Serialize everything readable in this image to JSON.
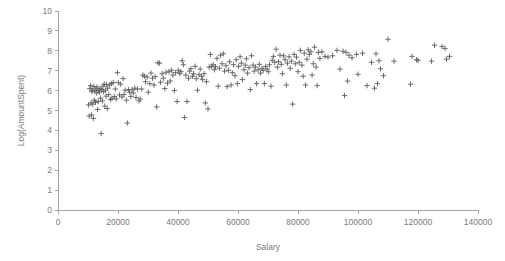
{
  "chart_data": {
    "type": "scatter",
    "title": "",
    "xlabel": "Salary",
    "ylabel": "Log(AmountSpent)",
    "xlim": [
      0,
      140000
    ],
    "ylim": [
      0,
      10
    ],
    "xticks": [
      0,
      20000,
      40000,
      60000,
      80000,
      100000,
      120000,
      140000
    ],
    "xtick_labels": [
      "0",
      "20000",
      "40000",
      "60000",
      "80000",
      "100000",
      "120000",
      "140000"
    ],
    "yticks": [
      0,
      1,
      2,
      3,
      4,
      5,
      6,
      7,
      8,
      9,
      10
    ],
    "ytick_labels": [
      "0",
      "1",
      "2",
      "3",
      "4",
      "5",
      "6",
      "7",
      "8",
      "9",
      "10"
    ],
    "grid": false,
    "legend": false,
    "marker": "plus",
    "marker_color": "#5d5d5d",
    "axis_color": "#9a9a9a",
    "text_color": "#7b7b7b",
    "series": [
      {
        "name": "Customers",
        "points": [
          [
            10200,
            5.28
          ],
          [
            10400,
            4.72
          ],
          [
            10600,
            6.1
          ],
          [
            10900,
            6.25
          ],
          [
            11000,
            5.38
          ],
          [
            11200,
            4.78
          ],
          [
            11300,
            5.95
          ],
          [
            11500,
            6.02
          ],
          [
            11600,
            5.32
          ],
          [
            11800,
            4.6
          ],
          [
            12000,
            6.2
          ],
          [
            12100,
            5.52
          ],
          [
            12300,
            5.98
          ],
          [
            12500,
            5.41
          ],
          [
            12700,
            6.08
          ],
          [
            12900,
            5.88
          ],
          [
            13000,
            6.18
          ],
          [
            13200,
            5.05
          ],
          [
            13400,
            5.45
          ],
          [
            13600,
            6.0
          ],
          [
            13800,
            5.92
          ],
          [
            14000,
            6.1
          ],
          [
            14200,
            5.62
          ],
          [
            14400,
            3.84
          ],
          [
            14600,
            6.05
          ],
          [
            14800,
            5.48
          ],
          [
            15000,
            6.22
          ],
          [
            15200,
            5.95
          ],
          [
            15400,
            6.32
          ],
          [
            15600,
            5.22
          ],
          [
            15800,
            6.02
          ],
          [
            16000,
            5.72
          ],
          [
            16200,
            6.3
          ],
          [
            16400,
            5.1
          ],
          [
            16600,
            6.12
          ],
          [
            16900,
            5.8
          ],
          [
            17200,
            6.28
          ],
          [
            17500,
            5.55
          ],
          [
            17800,
            6.35
          ],
          [
            18000,
            5.62
          ],
          [
            18400,
            6.4
          ],
          [
            18800,
            5.7
          ],
          [
            19100,
            6.08
          ],
          [
            19400,
            5.58
          ],
          [
            19800,
            6.9
          ],
          [
            20100,
            6.4
          ],
          [
            20500,
            5.78
          ],
          [
            20900,
            6.32
          ],
          [
            21300,
            5.68
          ],
          [
            21700,
            6.6
          ],
          [
            22000,
            5.8
          ],
          [
            22400,
            6.02
          ],
          [
            22800,
            5.52
          ],
          [
            23100,
            4.37
          ],
          [
            23500,
            6.05
          ],
          [
            23900,
            5.92
          ],
          [
            24300,
            5.7
          ],
          [
            24700,
            6.05
          ],
          [
            25100,
            5.88
          ],
          [
            25600,
            6.12
          ],
          [
            26000,
            5.65
          ],
          [
            26500,
            6.08
          ],
          [
            27000,
            5.48
          ],
          [
            27400,
            5.58
          ],
          [
            27900,
            6.08
          ],
          [
            28300,
            6.78
          ],
          [
            28800,
            6.72
          ],
          [
            29200,
            6.45
          ],
          [
            29700,
            6.68
          ],
          [
            30100,
            5.92
          ],
          [
            30600,
            6.35
          ],
          [
            31000,
            6.88
          ],
          [
            31500,
            6.62
          ],
          [
            32000,
            6.28
          ],
          [
            32400,
            6.7
          ],
          [
            32900,
            5.18
          ],
          [
            33300,
            7.4
          ],
          [
            33800,
            7.38
          ],
          [
            34200,
            6.42
          ],
          [
            34700,
            6.85
          ],
          [
            35100,
            6.62
          ],
          [
            35600,
            6.1
          ],
          [
            36000,
            6.92
          ],
          [
            36500,
            6.38
          ],
          [
            37000,
            6.95
          ],
          [
            37400,
            6.48
          ],
          [
            37900,
            7.02
          ],
          [
            38300,
            6.78
          ],
          [
            38800,
            6.0
          ],
          [
            39200,
            6.9
          ],
          [
            39700,
            5.45
          ],
          [
            40100,
            7.02
          ],
          [
            40600,
            6.85
          ],
          [
            41000,
            6.95
          ],
          [
            41400,
            7.5
          ],
          [
            41800,
            7.3
          ],
          [
            42200,
            4.65
          ],
          [
            42600,
            6.78
          ],
          [
            43000,
            5.45
          ],
          [
            43500,
            6.62
          ],
          [
            43900,
            6.98
          ],
          [
            44300,
            7.1
          ],
          [
            44800,
            6.72
          ],
          [
            45200,
            6.85
          ],
          [
            45700,
            7.22
          ],
          [
            46100,
            6.6
          ],
          [
            46500,
            6.02
          ],
          [
            47000,
            6.8
          ],
          [
            47400,
            7.08
          ],
          [
            47800,
            6.72
          ],
          [
            48200,
            6.55
          ],
          [
            48700,
            6.85
          ],
          [
            49100,
            5.38
          ],
          [
            49500,
            6.45
          ],
          [
            50000,
            5.08
          ],
          [
            50400,
            7.18
          ],
          [
            50800,
            7.82
          ],
          [
            51200,
            7.22
          ],
          [
            51700,
            7.3
          ],
          [
            52100,
            7.05
          ],
          [
            52500,
            7.2
          ],
          [
            53000,
            7.62
          ],
          [
            53400,
            6.22
          ],
          [
            53800,
            7.12
          ],
          [
            54200,
            7.78
          ],
          [
            54700,
            7.35
          ],
          [
            55100,
            7.85
          ],
          [
            55500,
            6.98
          ],
          [
            56000,
            7.25
          ],
          [
            56400,
            6.2
          ],
          [
            56800,
            7.02
          ],
          [
            57200,
            7.45
          ],
          [
            57700,
            6.28
          ],
          [
            58100,
            6.9
          ],
          [
            58500,
            7.3
          ],
          [
            59000,
            6.75
          ],
          [
            59400,
            7.55
          ],
          [
            59800,
            6.35
          ],
          [
            60200,
            7.22
          ],
          [
            60700,
            7.7
          ],
          [
            61100,
            7.38
          ],
          [
            61500,
            6.55
          ],
          [
            62000,
            7.05
          ],
          [
            62400,
            7.28
          ],
          [
            62800,
            7.6
          ],
          [
            63200,
            6.88
          ],
          [
            63700,
            7.15
          ],
          [
            64100,
            6.05
          ],
          [
            64500,
            7.75
          ],
          [
            65000,
            7.28
          ],
          [
            65400,
            6.98
          ],
          [
            65800,
            7.18
          ],
          [
            66200,
            6.35
          ],
          [
            66700,
            7.05
          ],
          [
            67100,
            7.32
          ],
          [
            67500,
            6.88
          ],
          [
            68000,
            7.12
          ],
          [
            68400,
            7.02
          ],
          [
            68800,
            6.35
          ],
          [
            69200,
            7.22
          ],
          [
            69700,
            7.08
          ],
          [
            70100,
            6.95
          ],
          [
            70500,
            7.3
          ],
          [
            71000,
            6.22
          ],
          [
            71400,
            7.52
          ],
          [
            71800,
            7.72
          ],
          [
            72200,
            7.42
          ],
          [
            72700,
            8.08
          ],
          [
            73100,
            7.18
          ],
          [
            73500,
            7.45
          ],
          [
            74000,
            7.78
          ],
          [
            74400,
            7.32
          ],
          [
            74800,
            6.85
          ],
          [
            75200,
            7.75
          ],
          [
            75700,
            7.55
          ],
          [
            76100,
            6.28
          ],
          [
            76500,
            7.38
          ],
          [
            77000,
            7.7
          ],
          [
            77400,
            7.12
          ],
          [
            77800,
            7.48
          ],
          [
            78200,
            5.32
          ],
          [
            78700,
            7.82
          ],
          [
            79100,
            7.35
          ],
          [
            79500,
            7.68
          ],
          [
            80000,
            6.95
          ],
          [
            80400,
            7.42
          ],
          [
            80800,
            8.02
          ],
          [
            81300,
            7.28
          ],
          [
            81700,
            6.72
          ],
          [
            82100,
            7.88
          ],
          [
            82500,
            6.28
          ],
          [
            83000,
            7.58
          ],
          [
            83400,
            8.05
          ],
          [
            83800,
            7.82
          ],
          [
            84300,
            7.95
          ],
          [
            84700,
            6.78
          ],
          [
            85100,
            7.35
          ],
          [
            85500,
            8.18
          ],
          [
            86000,
            7.18
          ],
          [
            86400,
            6.25
          ],
          [
            86800,
            7.92
          ],
          [
            87300,
            7.62
          ],
          [
            88000,
            7.95
          ],
          [
            89000,
            7.72
          ],
          [
            90000,
            7.68
          ],
          [
            91500,
            7.75
          ],
          [
            93000,
            8.02
          ],
          [
            94000,
            7.08
          ],
          [
            95000,
            7.98
          ],
          [
            95500,
            5.75
          ],
          [
            96000,
            7.92
          ],
          [
            96500,
            6.48
          ],
          [
            97000,
            7.78
          ],
          [
            98000,
            7.65
          ],
          [
            99500,
            7.82
          ],
          [
            100000,
            6.82
          ],
          [
            101500,
            7.88
          ],
          [
            103000,
            6.25
          ],
          [
            104500,
            7.42
          ],
          [
            105500,
            6.12
          ],
          [
            106000,
            7.85
          ],
          [
            106500,
            6.35
          ],
          [
            107000,
            7.5
          ],
          [
            107500,
            7.1
          ],
          [
            108500,
            6.75
          ],
          [
            110000,
            8.58
          ],
          [
            112000,
            7.48
          ],
          [
            117500,
            6.32
          ],
          [
            118000,
            7.72
          ],
          [
            119500,
            7.55
          ],
          [
            120000,
            7.52
          ],
          [
            124500,
            7.48
          ],
          [
            125500,
            8.28
          ],
          [
            128000,
            8.22
          ],
          [
            129000,
            8.12
          ],
          [
            129500,
            7.58
          ],
          [
            130500,
            7.72
          ]
        ]
      }
    ]
  },
  "axes": {
    "x_title": "Salary",
    "y_title": "Log(AmountSpent)"
  }
}
